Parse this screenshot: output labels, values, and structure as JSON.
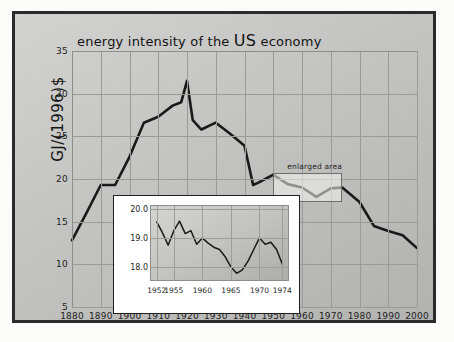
{
  "figure": {
    "title": "energy intensity of the US economy",
    "title_main": "energy intensity of the ",
    "title_big": "US",
    "title_tail": " economy",
    "ylabel": "GJ/(1996)$",
    "annotation": "enlarged area",
    "line_color": "#1a1a1a",
    "inset_line_color": "#1a1a1a",
    "grid_color": "#9a9a98",
    "panel_bg": "#c5c5c3",
    "frame_color": "#2b2b2b"
  },
  "chart_data": {
    "type": "line",
    "title": "energy intensity of the US economy",
    "xlabel": "",
    "ylabel": "GJ/(1996)$",
    "xlim": [
      1880,
      2000
    ],
    "ylim": [
      5,
      35
    ],
    "grid": true,
    "legend": "none",
    "xticks": [
      1880,
      1890,
      1900,
      1910,
      1920,
      1930,
      1940,
      1950,
      1960,
      1970,
      1980,
      1990,
      2000
    ],
    "yticks": [
      5,
      10,
      15,
      20,
      25,
      30,
      35
    ],
    "x": [
      1880,
      1885,
      1890,
      1895,
      1900,
      1905,
      1910,
      1915,
      1918,
      1920,
      1922,
      1925,
      1930,
      1935,
      1940,
      1943,
      1945,
      1950,
      1955,
      1960,
      1965,
      1970,
      1974,
      1980,
      1985,
      1990,
      1995,
      2000
    ],
    "values": [
      12.8,
      16.0,
      19.3,
      19.3,
      22.6,
      26.6,
      27.3,
      28.6,
      29.0,
      31.5,
      26.9,
      25.8,
      26.6,
      25.3,
      23.9,
      19.3,
      19.6,
      20.5,
      19.4,
      19.0,
      17.9,
      18.9,
      19.0,
      17.3,
      14.5,
      13.9,
      13.4,
      11.9
    ],
    "annotations": [
      {
        "text": "enlarged area",
        "x_range": [
          1950,
          1974
        ],
        "y_range": [
          17.3,
          20.7
        ]
      }
    ],
    "inset": {
      "type": "line",
      "xlim": [
        1951,
        1975
      ],
      "ylim": [
        17.55,
        20.1
      ],
      "xticks": [
        1952,
        1955,
        1960,
        1965,
        1970,
        1974
      ],
      "yticks": [
        18.0,
        19.0,
        20.0
      ],
      "ytick_labels": [
        "18.0",
        "19.0",
        "20.0"
      ],
      "grid": true,
      "x": [
        1952,
        1953,
        1954,
        1955,
        1956,
        1957,
        1958,
        1959,
        1960,
        1961,
        1962,
        1963,
        1964,
        1965,
        1966,
        1967,
        1968,
        1969,
        1970,
        1971,
        1972,
        1973,
        1974
      ],
      "values": [
        19.55,
        19.18,
        18.75,
        19.25,
        19.58,
        19.15,
        19.25,
        18.78,
        19.0,
        18.82,
        18.68,
        18.6,
        18.35,
        18.0,
        17.78,
        17.9,
        18.2,
        18.6,
        19.0,
        18.78,
        18.85,
        18.6,
        18.1
      ]
    }
  }
}
